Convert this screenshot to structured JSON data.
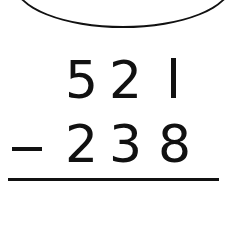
{
  "problem": {
    "operation": "subtraction",
    "operator_symbol": "−",
    "minuend": {
      "value": "521",
      "digits": [
        "5",
        "2",
        "1"
      ]
    },
    "subtrahend": {
      "value": "238",
      "digits": [
        "2",
        "3",
        "8"
      ]
    },
    "answer": ""
  },
  "decorations": {
    "oval": "answer-oval-outline",
    "rule": "sum-line"
  },
  "colors": {
    "ink": "#111111",
    "background": "#ffffff"
  }
}
